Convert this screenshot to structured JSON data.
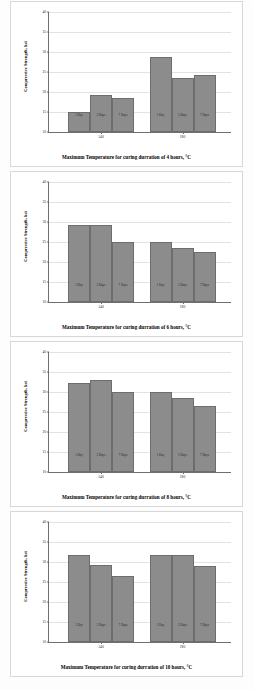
{
  "figure": {
    "background_color": "#fdfdfd",
    "bar_color": "#8c8c8c",
    "axis_color": "#6f6f6f",
    "grid_color": "#e2e2e2"
  },
  "chart_data": [
    {
      "type": "bar",
      "title": "",
      "xlabel": "Maximum Temperature for curing durration of 4 hours, °C",
      "ylabel": "Compressive Strength, ksi",
      "ylim": [
        10,
        40
      ],
      "yticks": [
        10,
        15,
        20,
        25,
        30,
        35,
        40
      ],
      "ytick_labels": [
        "10",
        "15",
        "20",
        "25",
        "30",
        "35",
        "40"
      ],
      "grid": true,
      "legend": "in-bar",
      "categories": [
        "140",
        "180"
      ],
      "series": [
        {
          "name": "1 Day",
          "values": [
            15.0,
            28.7
          ]
        },
        {
          "name": "3 Days",
          "values": [
            19.3,
            23.5
          ]
        },
        {
          "name": "7 Days",
          "values": [
            18.5,
            24.2
          ]
        }
      ]
    },
    {
      "type": "bar",
      "title": "",
      "xlabel": "Maximum Temperature for curing durration of 6 hours, °C",
      "ylabel": "Compressive Strength, ksi",
      "ylim": [
        10,
        40
      ],
      "yticks": [
        10,
        15,
        20,
        25,
        30,
        35,
        40
      ],
      "ytick_labels": [
        "10",
        "15",
        "20",
        "25",
        "30",
        "35",
        "40"
      ],
      "grid": true,
      "legend": "in-bar",
      "categories": [
        "140",
        "180"
      ],
      "series": [
        {
          "name": "1 Day",
          "values": [
            29.3,
            25.0
          ]
        },
        {
          "name": "3 Days",
          "values": [
            29.3,
            23.6
          ]
        },
        {
          "name": "7 Days",
          "values": [
            25.0,
            22.4
          ]
        }
      ]
    },
    {
      "type": "bar",
      "title": "",
      "xlabel": "Maximum Temperature for curing durration of 8 hours, °C",
      "ylabel": "Compressive Strength, ksi",
      "ylim": [
        10,
        40
      ],
      "yticks": [
        10,
        15,
        20,
        25,
        30,
        35,
        40
      ],
      "ytick_labels": [
        "10",
        "15",
        "20",
        "25",
        "30",
        "35",
        "40"
      ],
      "grid": true,
      "legend": "in-bar",
      "categories": [
        "140",
        "180"
      ],
      "series": [
        {
          "name": "1 Day",
          "values": [
            32.3,
            30.0
          ]
        },
        {
          "name": "3 Days",
          "values": [
            33.0,
            28.5
          ]
        },
        {
          "name": "7 Days",
          "values": [
            30.0,
            26.6
          ]
        }
      ]
    },
    {
      "type": "bar",
      "title": "",
      "xlabel": "Maximum Temperature for curing durration of 10 hours, °C",
      "ylabel": "Compressive Strength, ksi",
      "ylim": [
        10,
        40
      ],
      "yticks": [
        10,
        15,
        20,
        25,
        30,
        35,
        40
      ],
      "ytick_labels": [
        "10",
        "15",
        "20",
        "25",
        "30",
        "35",
        "40"
      ],
      "grid": true,
      "legend": "in-bar",
      "categories": [
        "140",
        "180"
      ],
      "series": [
        {
          "name": "1 Day",
          "values": [
            31.7,
            31.7
          ]
        },
        {
          "name": "3 Days",
          "values": [
            29.2,
            31.7
          ]
        },
        {
          "name": "7 Days",
          "values": [
            26.6,
            29.0
          ]
        }
      ]
    }
  ]
}
